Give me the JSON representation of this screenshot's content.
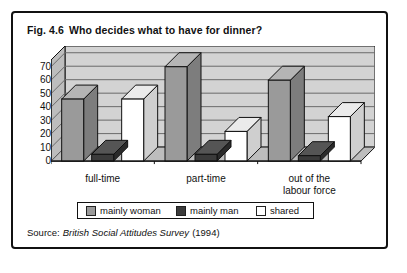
{
  "figure": {
    "number": "Fig. 4.6",
    "title": "Who decides what to have for dinner?"
  },
  "source": {
    "label": "Source:",
    "publication": "British Social Attitudes Survey",
    "year": "(1994)"
  },
  "legend": {
    "items": [
      {
        "label": "mainly woman",
        "color": "#9a9a9a"
      },
      {
        "label": "mainly man",
        "color": "#3b3b3b"
      },
      {
        "label": "shared",
        "color": "#ffffff"
      }
    ]
  },
  "colors": {
    "plot_background": "#d3d3d3",
    "gridline": "#6a6a6a",
    "wall_side": "#bdbdbd",
    "frame": "#111111",
    "bar_woman": "#9a9a9a",
    "bar_woman_side": "#7d7d7d",
    "bar_woman_top": "#b5b5b5",
    "bar_man": "#3b3b3b",
    "bar_man_side": "#2a2a2a",
    "bar_man_top": "#555555",
    "bar_shared": "#ffffff",
    "bar_shared_side": "#cfcfcf",
    "bar_shared_top": "#ebebeb"
  },
  "chart_data": {
    "type": "bar",
    "subtitle": "",
    "xlabel": "",
    "ylabel": "",
    "ylim": [
      0,
      75
    ],
    "yticks": [
      0,
      10,
      20,
      30,
      40,
      50,
      60,
      70
    ],
    "ytick_labels": [
      "0",
      "10",
      "20",
      "30",
      "40",
      "50",
      "60",
      "70"
    ],
    "grid": true,
    "legend_position": "bottom",
    "three_d": true,
    "categories": [
      "full-time",
      "part-time",
      "out of the\nlabour force"
    ],
    "series": [
      {
        "name": "mainly woman",
        "values": [
          46,
          70,
          60
        ]
      },
      {
        "name": "mainly man",
        "values": [
          5,
          5,
          4
        ]
      },
      {
        "name": "shared",
        "values": [
          46,
          22,
          33
        ]
      }
    ]
  }
}
